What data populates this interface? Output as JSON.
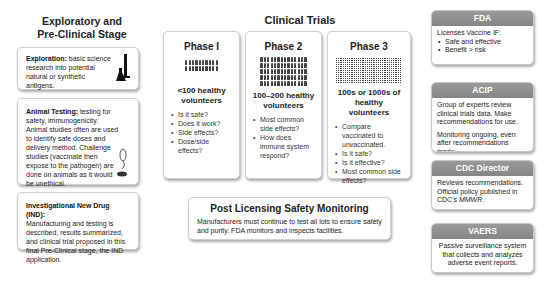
{
  "preclinical": {
    "title_line1": "Exploratory and",
    "title_line2": "Pre-Clinical Stage",
    "exploration": {
      "label": "Exploration:",
      "text": " basic science research into potential natural or synthetic antigens.",
      "icon": "lab-flask-icon"
    },
    "animal_testing": {
      "label": "Animal Testing:",
      "text": " testing for safety, immunogenicity. Animal studies often are used to identify safe doses and delivery method. Challenge studies (vaccinate then expose to the pathogen) are done on animals as it would be unethical.",
      "icon": "mouse-icon"
    },
    "ind": {
      "label": "Investigational New Drug (IND):",
      "text": " Manufacturing and testing is described, results summarized, and clinical trial proposed in this final Pre-Clinical stage, the IND application."
    }
  },
  "clinical_trials": {
    "title": "Clinical Trials",
    "phases": [
      {
        "title": "Phase I",
        "volunteers": "<100 healthy volunteers",
        "people_count": 20,
        "questions": [
          "Is it safe?",
          "Does it work?",
          "Side effects?",
          "Dose/side effects?"
        ]
      },
      {
        "title": "Phase 2",
        "volunteers": "100–200 healthy volunteers",
        "people_count": 70,
        "questions": [
          "Most common side effects?",
          "How does immune system respond?"
        ]
      },
      {
        "title": "Phase 3",
        "volunteers": "100s or 1000s of healthy volunteers",
        "questions": [
          "Compare vaccinated to unvaccinated.",
          "Is it safe?",
          "Is it effective?",
          "Most common side effects?"
        ]
      }
    ]
  },
  "post_licensing": {
    "title": "Post Licensing Safety Monitoring",
    "text": "Manufacturers must continue to test all lots to ensure safety and purity. FDA monitors and inspects facilities."
  },
  "agencies": {
    "fda": {
      "name": "FDA",
      "intro": "Licenses Vaccine IF:",
      "items": [
        "Safe and effective",
        "Benefit > risk"
      ]
    },
    "acip": {
      "name": "ACIP",
      "p1": "Group of experts review clinical trials data. Make recommendations for use.",
      "p2": "Monitoring ongoing, even after recommendations made."
    },
    "cdc": {
      "name": "CDC Director",
      "text": "Reviews recommendations. Official policy published in CDC's ",
      "mmwr": "MMWR",
      "end": "."
    },
    "vaers": {
      "name": "VAERS",
      "text": "Passive surveillance system that collects and analyzes adverse event reports."
    }
  },
  "colors": {
    "agency_header": "#8e8e8e",
    "card_border": "#cfcfcf"
  }
}
